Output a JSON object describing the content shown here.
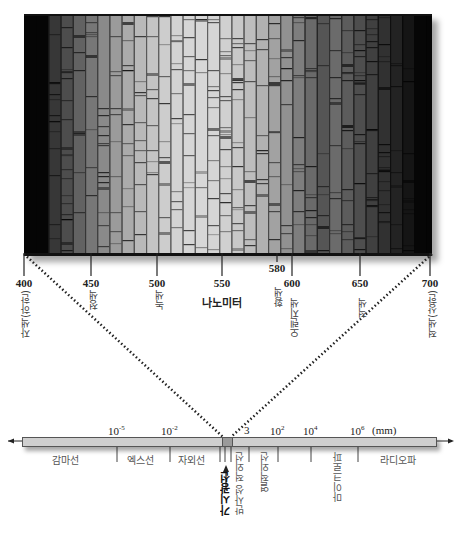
{
  "figure": {
    "spectrum_panel": {
      "x_unit_label": "나노미터",
      "ticks": [
        {
          "value": "400",
          "x": 24
        },
        {
          "value": "450",
          "x": 91
        },
        {
          "value": "500",
          "x": 157
        },
        {
          "value": "550",
          "x": 222
        },
        {
          "value": "580",
          "x": 277,
          "short": true
        },
        {
          "value": "600",
          "x": 292
        },
        {
          "value": "650",
          "x": 360
        },
        {
          "value": "700",
          "x": 430
        }
      ],
      "color_labels": [
        {
          "text": "자색(하한)",
          "x": 18,
          "y": 290
        },
        {
          "text": "청색",
          "x": 86,
          "y": 290
        },
        {
          "text": "녹색",
          "x": 152,
          "y": 290
        },
        {
          "text": "황색",
          "x": 271,
          "y": 287
        },
        {
          "text": "오렌지색",
          "x": 287,
          "y": 298
        },
        {
          "text": "적색",
          "x": 355,
          "y": 298
        },
        {
          "text": "적색(상한)",
          "x": 425,
          "y": 290
        }
      ]
    },
    "em_scale": {
      "unit": "(mm)",
      "exponents": [
        {
          "base": "10",
          "exp": "-5",
          "x": 108
        },
        {
          "base": "10",
          "exp": "-2",
          "x": 161
        },
        {
          "base": "3",
          "exp": "",
          "x": 244
        },
        {
          "base": "10",
          "exp": "2",
          "x": 270
        },
        {
          "base": "10",
          "exp": "4",
          "x": 303
        },
        {
          "base": "10",
          "exp": "6",
          "x": 350
        }
      ],
      "bands_horizontal": [
        {
          "text": "감마선",
          "x": 52
        },
        {
          "text": "엑스선",
          "x": 127
        },
        {
          "text": "자외선",
          "x": 178
        },
        {
          "text": "라디오파",
          "x": 380
        }
      ],
      "bands_vertical": [
        {
          "text": "반사성 적외선",
          "x": 232,
          "y": 452
        },
        {
          "text": "열적외선",
          "x": 257,
          "y": 452
        },
        {
          "text": "마이크로파",
          "x": 330,
          "y": 452
        }
      ],
      "visible_label": "가시광선",
      "dividers_x": [
        117,
        170,
        220,
        225,
        231,
        249,
        278,
        311,
        358
      ]
    }
  }
}
